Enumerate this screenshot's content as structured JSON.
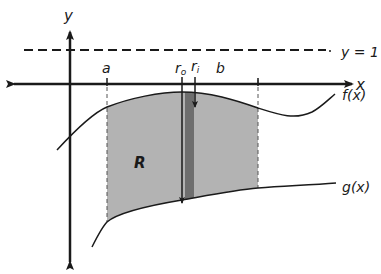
{
  "diagram": {
    "type": "area-between-curves-revolution",
    "axes": {
      "x_label": "x",
      "y_label": "y"
    },
    "horizontal_line": {
      "label": "y = 1",
      "style": "dashed"
    },
    "bounds": {
      "left": "a",
      "right": "b"
    },
    "radii": {
      "outer": "r",
      "outer_sub": "o",
      "inner": "r",
      "inner_sub": "i"
    },
    "region_label": "R",
    "curves": {
      "upper": "f(x)",
      "lower": "g(x)"
    },
    "colors": {
      "region_fill": "#b3b3b3",
      "strip_fill": "#6e6e6e",
      "line": "#1a1a1a"
    }
  }
}
